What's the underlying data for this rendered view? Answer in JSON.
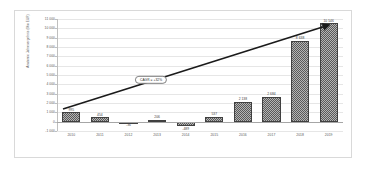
{
  "chart_data": {
    "type": "bar",
    "title": "",
    "xlabel": "",
    "ylabel": "Anatomic Jahresergebnis (Mio EUR)",
    "categories": [
      "2010",
      "2011",
      "2012",
      "2013",
      "2014",
      "2015",
      "2016",
      "2017",
      "2018",
      "2019"
    ],
    "values": [
      995,
      454,
      -36,
      206,
      -489,
      537,
      2138,
      2684,
      8638,
      10546
    ],
    "value_labels": [
      "995",
      "454",
      "-36",
      "206",
      "-489",
      "537",
      "2 138",
      "2 684",
      "8 638",
      "10 546"
    ],
    "ylim": [
      -1000,
      11000
    ],
    "ytick_values": [
      11000,
      10000,
      9000,
      8000,
      7000,
      6000,
      5000,
      4000,
      3000,
      2000,
      1000,
      0,
      -1000
    ],
    "ytick_labels": [
      "11 000",
      "10 000",
      "9 000",
      "8 000",
      "7 000",
      "6 000",
      "5 000",
      "4 000",
      "3 000",
      "2 000",
      "1 000",
      "0",
      "-1 000"
    ],
    "grid": true,
    "legend": "none",
    "series": [
      {
        "name": "Jahresergebnis",
        "values": [
          995,
          454,
          -36,
          206,
          -489,
          537,
          2138,
          2684,
          8638,
          10546
        ]
      }
    ],
    "annotations": [
      {
        "name": "cagr-callout",
        "text": "CAGR = +32%",
        "shape": "pill"
      },
      {
        "name": "trend-arrow",
        "type": "arrow",
        "from_year": "2010",
        "to_year": "2019"
      }
    ],
    "colors": {
      "bar_fill": "#595959",
      "bar_border": "#404040",
      "grid": "#e6e6e6",
      "axis": "#bfbfbf",
      "text": "#595959",
      "trend_line": "#1a1a1a",
      "frame_border": "#d9d9d9",
      "background": "#ffffff"
    }
  }
}
